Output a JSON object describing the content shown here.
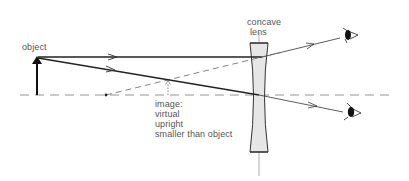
{
  "labels": {
    "object": "object",
    "lens_line1": "concave",
    "lens_line2": "lens",
    "image_lines": [
      "image:",
      "virtual",
      "upright",
      "smaller than object"
    ]
  },
  "colors": {
    "ray": "#222222",
    "axis": "#888888",
    "lens_fill": "#e6e6e6",
    "lens_stroke": "#333333",
    "text": "#555555"
  },
  "geometry": {
    "axis_y": 95,
    "object": {
      "x": 37,
      "top_y": 57
    },
    "lens": {
      "x": 259,
      "top_y": 43,
      "bottom_y": 152
    },
    "focal_point": {
      "x": 106,
      "y": 95
    },
    "image": {
      "x": 168,
      "top_y": 80
    },
    "eyes": [
      {
        "x": 343,
        "y": 37
      },
      {
        "x": 345,
        "y": 113
      }
    ]
  },
  "icons": [
    "eye-icon-upper",
    "eye-icon-lower",
    "object-arrow-icon",
    "focal-point-dot"
  ]
}
